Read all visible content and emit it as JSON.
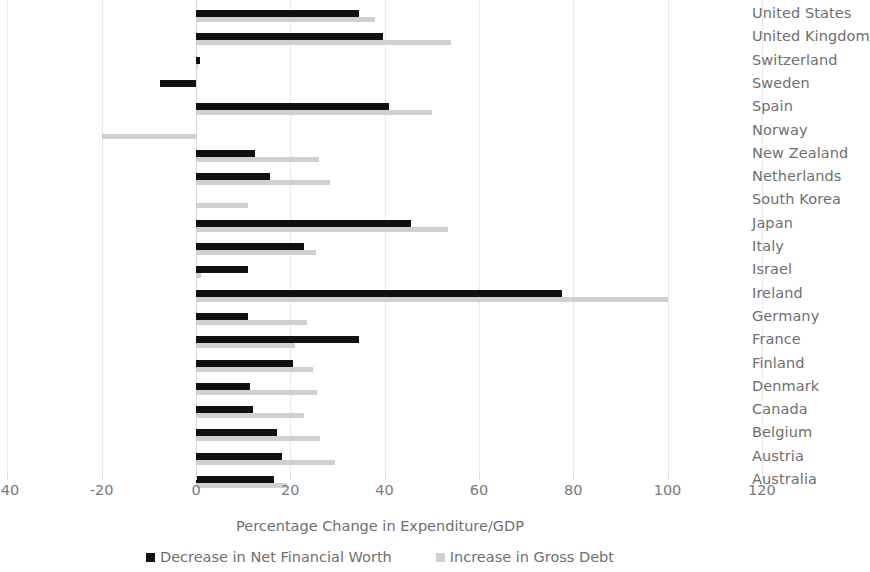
{
  "chart_data": {
    "type": "bar",
    "orientation": "horizontal",
    "title": "",
    "xlabel": "Percentage Change in Expenditure/GDP",
    "ylabel": "",
    "xlim": [
      -40,
      120
    ],
    "xticks": [
      -40,
      -20,
      0,
      20,
      40,
      60,
      80,
      100,
      120
    ],
    "xtick_labels": [
      "-40",
      "-20",
      "0",
      "20",
      "40",
      "60",
      "80",
      "100",
      "120"
    ],
    "grid": true,
    "legend_position": "bottom",
    "categories": [
      "United States",
      "United Kingdom",
      "Switzerland",
      "Sweden",
      "Spain",
      "Norway",
      "New Zealand",
      "Netherlands",
      "South Korea",
      "Japan",
      "Italy",
      "Israel",
      "Ireland",
      "Germany",
      "France",
      "Finland",
      "Denmark",
      "Canada",
      "Belgium",
      "Austria",
      "Australia"
    ],
    "series": [
      {
        "name": "Decrease in Net Financial Worth",
        "color": "#111111",
        "values": [
          34.5,
          39.6,
          0.8,
          -7.6,
          41.0,
          0,
          12.5,
          15.7,
          0,
          45.5,
          23.0,
          11.0,
          77.7,
          11.0,
          34.5,
          20.5,
          11.5,
          12.0,
          17.2,
          18.3,
          16.6
        ]
      },
      {
        "name": "Increase in Gross Debt",
        "color": "#d0d0d0",
        "values": [
          38.0,
          54.0,
          0.3,
          0,
          50.0,
          -20.0,
          26.0,
          28.5,
          11.0,
          53.5,
          25.5,
          1.0,
          100.0,
          23.6,
          21.0,
          24.8,
          25.7,
          23.0,
          26.2,
          29.5,
          19.4
        ]
      }
    ]
  },
  "legend": {
    "items": [
      {
        "label": "Decrease in Net Financial Worth",
        "swatch": "dark"
      },
      {
        "label": "Increase in Gross Debt",
        "swatch": "light"
      }
    ]
  }
}
